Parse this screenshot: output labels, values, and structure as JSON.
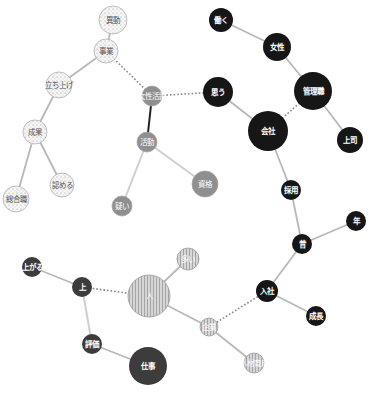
{
  "diagram": {
    "type": "co-occurrence network",
    "width": 370,
    "height": 393,
    "colors": {
      "edge_solid": "#b8b8b8",
      "edge_strong": "#222222",
      "edge_dotted": "#8a8a8a",
      "node_black": "#161616",
      "node_darkgray": "#3c3c3c",
      "node_gray": "#8f8f8f",
      "node_dotted_fill": "#f4f4f4",
      "node_striped_fill": "#d0d0d0"
    },
    "nodes": [
      {
        "id": "idou",
        "label": "異動",
        "x": 113,
        "y": 20,
        "r": 14,
        "style": "dotted"
      },
      {
        "id": "jigyo",
        "label": "事業",
        "x": 106,
        "y": 51,
        "r": 12,
        "style": "dotted"
      },
      {
        "id": "tachiage",
        "label": "立ち上げ",
        "x": 59,
        "y": 85,
        "r": 13,
        "style": "dotted"
      },
      {
        "id": "seika",
        "label": "成果",
        "x": 35,
        "y": 132,
        "r": 12,
        "style": "dotted"
      },
      {
        "id": "sogoshoku",
        "label": "総合職",
        "x": 16,
        "y": 199,
        "r": 13,
        "style": "dotted"
      },
      {
        "id": "mitomeru",
        "label": "認める",
        "x": 62,
        "y": 185,
        "r": 12,
        "style": "dotted"
      },
      {
        "id": "joseikatsuyaku",
        "label": "女性活躍",
        "x": 152,
        "y": 96,
        "r": 10,
        "style": "gray"
      },
      {
        "id": "katsudo",
        "label": "活動",
        "x": 147,
        "y": 142,
        "r": 10,
        "style": "gray"
      },
      {
        "id": "utagai",
        "label": "疑い",
        "x": 122,
        "y": 206,
        "r": 10,
        "style": "gray"
      },
      {
        "id": "shikaku",
        "label": "資格",
        "x": 205,
        "y": 184,
        "r": 13,
        "style": "gray"
      },
      {
        "id": "hataraku",
        "label": "働く",
        "x": 221,
        "y": 20,
        "r": 12,
        "style": "black"
      },
      {
        "id": "josei",
        "label": "女性",
        "x": 277,
        "y": 47,
        "r": 14,
        "style": "black"
      },
      {
        "id": "kanrishoku",
        "label": "管理職",
        "x": 313,
        "y": 91,
        "r": 19,
        "style": "black"
      },
      {
        "id": "omou",
        "label": "思う",
        "x": 218,
        "y": 92,
        "r": 15,
        "style": "black"
      },
      {
        "id": "kaisha",
        "label": "会社",
        "x": 268,
        "y": 131,
        "r": 20,
        "style": "black"
      },
      {
        "id": "joshi",
        "label": "上司",
        "x": 350,
        "y": 140,
        "r": 13,
        "style": "black"
      },
      {
        "id": "saiyo",
        "label": "採用",
        "x": 291,
        "y": 190,
        "r": 10,
        "style": "black"
      },
      {
        "id": "nen",
        "label": "年",
        "x": 356,
        "y": 221,
        "r": 10,
        "style": "black"
      },
      {
        "id": "mukashi",
        "label": "昔",
        "x": 302,
        "y": 244,
        "r": 10,
        "style": "black"
      },
      {
        "id": "nyusha",
        "label": "入社",
        "x": 267,
        "y": 291,
        "r": 11,
        "style": "black"
      },
      {
        "id": "seicho",
        "label": "成長",
        "x": 316,
        "y": 316,
        "r": 10,
        "style": "black"
      },
      {
        "id": "agaru",
        "label": "上がる",
        "x": 32,
        "y": 267,
        "r": 10,
        "style": "darkgray"
      },
      {
        "id": "ue",
        "label": "上",
        "x": 82,
        "y": 287,
        "r": 10,
        "style": "darkgray"
      },
      {
        "id": "hito",
        "label": "人",
        "x": 149,
        "y": 296,
        "r": 21,
        "style": "striped"
      },
      {
        "id": "ooi",
        "label": "多い",
        "x": 188,
        "y": 259,
        "r": 11,
        "style": "striped"
      },
      {
        "id": "kigyo",
        "label": "企業",
        "x": 209,
        "y": 327,
        "r": 9,
        "style": "striped"
      },
      {
        "id": "jinzaiikusei",
        "label": "人材育成",
        "x": 254,
        "y": 363,
        "r": 10,
        "style": "striped"
      },
      {
        "id": "hyoka",
        "label": "評価",
        "x": 92,
        "y": 344,
        "r": 10,
        "style": "darkgray"
      },
      {
        "id": "shigoto",
        "label": "仕事",
        "x": 148,
        "y": 366,
        "r": 19,
        "style": "darkgray"
      }
    ],
    "edges": [
      {
        "from": "idou",
        "to": "jigyo",
        "style": "solid"
      },
      {
        "from": "jigyo",
        "to": "tachiage",
        "style": "solid"
      },
      {
        "from": "tachiage",
        "to": "seika",
        "style": "solid"
      },
      {
        "from": "seika",
        "to": "sogoshoku",
        "style": "solid"
      },
      {
        "from": "seika",
        "to": "mitomeru",
        "style": "solid"
      },
      {
        "from": "jigyo",
        "to": "joseikatsuyaku",
        "style": "dotted"
      },
      {
        "from": "joseikatsuyaku",
        "to": "omou",
        "style": "dotted"
      },
      {
        "from": "joseikatsuyaku",
        "to": "katsudo",
        "style": "strong"
      },
      {
        "from": "katsudo",
        "to": "utagai",
        "style": "light"
      },
      {
        "from": "katsudo",
        "to": "shikaku",
        "style": "light"
      },
      {
        "from": "hataraku",
        "to": "josei",
        "style": "solid"
      },
      {
        "from": "josei",
        "to": "kanrishoku",
        "style": "solid"
      },
      {
        "from": "kanrishoku",
        "to": "joshi",
        "style": "solid"
      },
      {
        "from": "kanrishoku",
        "to": "kaisha",
        "style": "dotted"
      },
      {
        "from": "omou",
        "to": "kaisha",
        "style": "solid"
      },
      {
        "from": "kaisha",
        "to": "saiyo",
        "style": "solid"
      },
      {
        "from": "saiyo",
        "to": "mukashi",
        "style": "solid"
      },
      {
        "from": "mukashi",
        "to": "nen",
        "style": "solid"
      },
      {
        "from": "mukashi",
        "to": "nyusha",
        "style": "solid"
      },
      {
        "from": "nyusha",
        "to": "seicho",
        "style": "solid"
      },
      {
        "from": "nyusha",
        "to": "kigyo",
        "style": "dotted"
      },
      {
        "from": "agaru",
        "to": "ue",
        "style": "solid"
      },
      {
        "from": "ue",
        "to": "hito",
        "style": "dotted"
      },
      {
        "from": "ue",
        "to": "hyoka",
        "style": "light"
      },
      {
        "from": "hyoka",
        "to": "shigoto",
        "style": "solid"
      },
      {
        "from": "hito",
        "to": "ooi",
        "style": "solid"
      },
      {
        "from": "hito",
        "to": "kigyo",
        "style": "solid"
      },
      {
        "from": "kigyo",
        "to": "jinzaiikusei",
        "style": "solid"
      }
    ]
  }
}
